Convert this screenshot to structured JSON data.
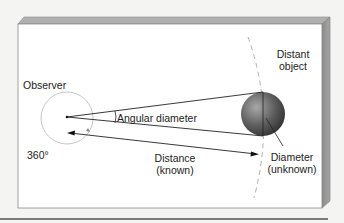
{
  "diagram": {
    "labels": {
      "observer": "Observer",
      "full_circle": "360°",
      "angular_diameter": "Angular diameter",
      "distance_line1": "Distance",
      "distance_line2": "(known)",
      "diameter_line1": "Diameter",
      "diameter_line2": "(unknown)",
      "object_line1": "Distant",
      "object_line2": "object"
    },
    "colors": {
      "background": "#f4f4f2",
      "panel_face": "#ffffff",
      "panel_edge": "#8a8a8a",
      "panel_side": "#9a9a9a",
      "sphere_light": "#9a9a9a",
      "sphere_dark": "#3a3a3a",
      "lines": "#222222",
      "circle": "#b8b8b8",
      "bottom_rule": "#7a7a7a"
    }
  }
}
